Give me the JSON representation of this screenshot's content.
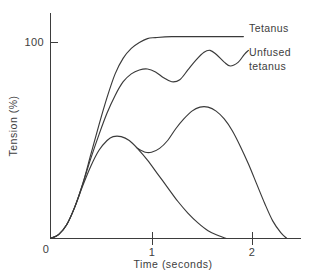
{
  "chart_data": {
    "type": "line",
    "title": "",
    "subtitle": "",
    "xlabel": "Time (seconds)",
    "ylabel": "Tension (%)",
    "xlim": [
      0,
      2.48
    ],
    "ylim": [
      0,
      122
    ],
    "grid": false,
    "legend_position": "inline-right",
    "xticks": [
      0,
      1,
      2
    ],
    "xtick_labels": [
      "0",
      "1",
      "2"
    ],
    "yticks": [
      100
    ],
    "ytick_labels": [
      "100"
    ],
    "annotations": [
      {
        "text": "Tetanus",
        "x": 1.92,
        "y": 103
      },
      {
        "text": "Unfused",
        "x": 1.95,
        "y": 92
      },
      {
        "text": "tetanus",
        "x": 1.95,
        "y": 82
      }
    ],
    "series": [
      {
        "name": "Tetanus",
        "label": "Tetanus",
        "points": [
          [
            0.0,
            0
          ],
          [
            0.08,
            2
          ],
          [
            0.16,
            7
          ],
          [
            0.24,
            16
          ],
          [
            0.32,
            28
          ],
          [
            0.4,
            43
          ],
          [
            0.48,
            58
          ],
          [
            0.56,
            72
          ],
          [
            0.64,
            84
          ],
          [
            0.72,
            92
          ],
          [
            0.8,
            97
          ],
          [
            0.88,
            100
          ],
          [
            0.96,
            102
          ],
          [
            1.04,
            102.5
          ],
          [
            1.2,
            103
          ],
          [
            1.45,
            103
          ],
          [
            1.7,
            103
          ],
          [
            1.91,
            103
          ]
        ]
      },
      {
        "name": "Unfused tetanus",
        "label": "Unfused tetanus",
        "points": [
          [
            0.0,
            0
          ],
          [
            0.08,
            2
          ],
          [
            0.16,
            7
          ],
          [
            0.24,
            16
          ],
          [
            0.32,
            28
          ],
          [
            0.4,
            41
          ],
          [
            0.48,
            53
          ],
          [
            0.56,
            64
          ],
          [
            0.64,
            73
          ],
          [
            0.72,
            80
          ],
          [
            0.8,
            84
          ],
          [
            0.88,
            86
          ],
          [
            0.96,
            86.5
          ],
          [
            1.04,
            85
          ],
          [
            1.12,
            82
          ],
          [
            1.2,
            80
          ],
          [
            1.28,
            81
          ],
          [
            1.36,
            86
          ],
          [
            1.44,
            91
          ],
          [
            1.52,
            95
          ],
          [
            1.58,
            96
          ],
          [
            1.64,
            94
          ],
          [
            1.72,
            90
          ],
          [
            1.78,
            88
          ],
          [
            1.86,
            90
          ],
          [
            1.92,
            94
          ],
          [
            1.96,
            96
          ]
        ]
      },
      {
        "name": "Single twitch",
        "label": "",
        "points": [
          [
            0.0,
            0
          ],
          [
            0.08,
            2
          ],
          [
            0.16,
            7
          ],
          [
            0.24,
            16
          ],
          [
            0.32,
            27
          ],
          [
            0.4,
            37
          ],
          [
            0.48,
            45
          ],
          [
            0.56,
            50
          ],
          [
            0.62,
            52
          ],
          [
            0.7,
            52
          ],
          [
            0.78,
            50
          ],
          [
            0.86,
            46
          ],
          [
            0.96,
            40
          ],
          [
            1.06,
            33
          ],
          [
            1.16,
            26
          ],
          [
            1.26,
            19
          ],
          [
            1.36,
            13
          ],
          [
            1.46,
            8
          ],
          [
            1.56,
            4
          ],
          [
            1.66,
            1.5
          ],
          [
            1.74,
            0
          ]
        ]
      },
      {
        "name": "Summation",
        "label": "",
        "points": [
          [
            0.86,
            46
          ],
          [
            0.94,
            44
          ],
          [
            1.0,
            44
          ],
          [
            1.08,
            46
          ],
          [
            1.16,
            50
          ],
          [
            1.24,
            56
          ],
          [
            1.32,
            61
          ],
          [
            1.4,
            65
          ],
          [
            1.48,
            67
          ],
          [
            1.56,
            67
          ],
          [
            1.64,
            65
          ],
          [
            1.72,
            61
          ],
          [
            1.8,
            55
          ],
          [
            1.88,
            47
          ],
          [
            1.96,
            38
          ],
          [
            2.04,
            28
          ],
          [
            2.12,
            18
          ],
          [
            2.2,
            9
          ],
          [
            2.28,
            3
          ],
          [
            2.34,
            0
          ]
        ]
      }
    ]
  },
  "axes": {
    "y_tick_100": "100",
    "x_tick_0": "0",
    "x_tick_1": "1",
    "x_tick_2": "2",
    "y_axis_title": "Tension (%)",
    "x_axis_title": "Time (seconds)"
  },
  "labels": {
    "tetanus": "Tetanus",
    "unfused_line1": "Unfused",
    "unfused_line2": "tetanus"
  },
  "colors": {
    "curve": "#3a3a3a",
    "axis": "#3d3d3d",
    "background": "#ffffff"
  }
}
